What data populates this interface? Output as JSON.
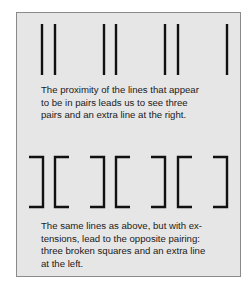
{
  "figure1": {
    "description": "Seven vertical lines: three close pairs and a single extra line at the right",
    "caption": "The proximity of the lines that appear to be in pairs leads us to see three pairs and an extra line at the right.",
    "caption_lines": [
      "The proximity of the lines that appear",
      "to be in pairs leads us to see three",
      "pairs and an extra line at the right."
    ],
    "line_x": [
      42,
      55,
      104,
      116,
      165,
      178,
      227
    ],
    "line_top": 24,
    "line_bottom": 75
  },
  "figure2": {
    "description": "Same seven lines with horizontal extensions forming brackets: a single line at left, then three broken squares",
    "caption": "The same lines as above, but with extensions, lead to the opposite pairing: three broken squares and an extra line at the left.",
    "caption_lines": [
      "The same lines as above, but with ex-",
      "tensions, lead to the opposite pairing:",
      "three broken squares and an extra line",
      "at the left."
    ],
    "brackets": [
      {
        "type": "right",
        "x": 43
      },
      {
        "type": "left",
        "x": 55
      },
      {
        "type": "right",
        "x": 104
      },
      {
        "type": "left",
        "x": 116
      },
      {
        "type": "right",
        "x": 165
      },
      {
        "type": "left",
        "x": 178
      },
      {
        "type": "right",
        "x": 227
      }
    ],
    "extension": 14,
    "top": 157,
    "bottom": 207
  },
  "colors": {
    "panel_bg": "#e6e6e6",
    "panel_border": "#8a8a8a",
    "line": "#111111",
    "text": "#1a1a1a"
  }
}
